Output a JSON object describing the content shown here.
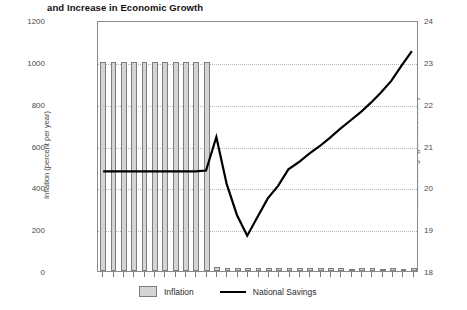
{
  "chart_data": {
    "type": "bar",
    "title": "and Increase in Economic Growth",
    "xlabel": "",
    "ylabel": "Inflation (percent per year)",
    "y2label": "National Savings (percent of GDP)",
    "ylim": [
      0,
      1200
    ],
    "y2lim": [
      18,
      24
    ],
    "yticks": [
      0,
      200,
      400,
      600,
      800,
      1000,
      1200
    ],
    "y2ticks": [
      18,
      19,
      20,
      21,
      22,
      23,
      24
    ],
    "grid": true,
    "legend_position": "bottom",
    "x": [
      1,
      2,
      3,
      4,
      5,
      6,
      7,
      8,
      9,
      10,
      11,
      12,
      13,
      14,
      15,
      16,
      17,
      18,
      19,
      20,
      21,
      22,
      23,
      24,
      25,
      26,
      27,
      28,
      29,
      30,
      31
    ],
    "series": [
      {
        "name": "Inflation",
        "type": "bar",
        "axis": "left",
        "color": "#d4d4d4",
        "edge_color": "#7d7d7d",
        "values": [
          1000,
          1000,
          1000,
          1000,
          1000,
          1000,
          1000,
          1000,
          1000,
          1000,
          1000,
          18,
          16,
          15,
          14,
          16,
          15,
          14,
          13,
          15,
          14,
          13,
          14,
          13,
          12,
          14,
          13,
          12,
          13,
          12,
          13
        ]
      },
      {
        "name": "National Savings",
        "type": "line",
        "axis": "right",
        "color": "#000000",
        "values": [
          20.4,
          20.4,
          20.4,
          20.4,
          20.4,
          20.4,
          20.4,
          20.4,
          20.4,
          20.4,
          20.42,
          21.23,
          20.1,
          19.35,
          18.85,
          19.3,
          19.75,
          20.05,
          20.45,
          20.62,
          20.82,
          21.0,
          21.2,
          21.42,
          21.62,
          21.82,
          22.05,
          22.3,
          22.58,
          22.95,
          23.3
        ]
      }
    ]
  },
  "legend": {
    "items": [
      {
        "label": "Inflation",
        "marker": "swatch"
      },
      {
        "label": "National Savings",
        "marker": "line"
      }
    ]
  },
  "axes": {
    "left_title": "Inflation (percent per year)",
    "right_title": "National Savings (percent of GDP)",
    "left_ticks": [
      "0",
      "200",
      "400",
      "600",
      "800",
      "1000",
      "1200"
    ],
    "right_ticks": [
      "18",
      "19",
      "20",
      "21",
      "22",
      "23",
      "24"
    ]
  }
}
